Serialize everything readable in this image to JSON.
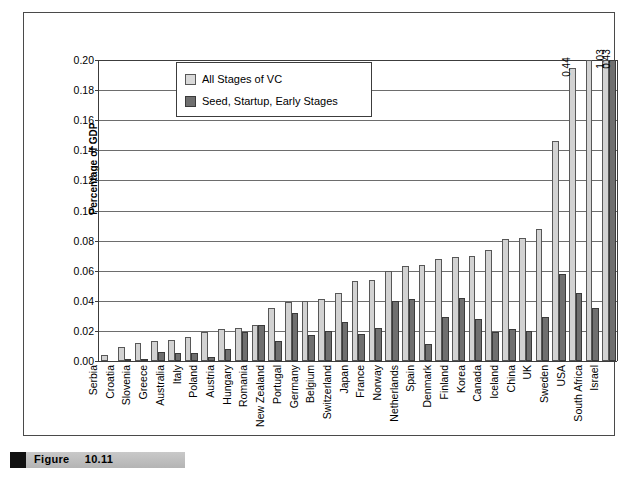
{
  "figure": {
    "caption_label": "Figure",
    "caption_number": "10.11"
  },
  "legend": {
    "position": "inside-top-left",
    "items": [
      {
        "label": "All Stages of VC",
        "color": "#d2d2d2",
        "swatch": "light-square-icon"
      },
      {
        "label": "Seed, Startup, Early Stages",
        "color": "#6f6f6f",
        "swatch": "dark-square-icon"
      }
    ]
  },
  "chart_data": {
    "type": "bar",
    "title": "",
    "subtitle": "",
    "xlabel": "",
    "ylabel": "Percentage of GDP",
    "ylim": [
      0.0,
      0.2
    ],
    "ytick_values": [
      0.0,
      0.02,
      0.04,
      0.06,
      0.08,
      0.1,
      0.12,
      0.14,
      0.16,
      0.18,
      0.2
    ],
    "ytick_labels": [
      "0.00",
      "0.02",
      "0.04",
      "0.06",
      "0.08",
      "0.10",
      "0.12",
      "0.14",
      "0.16",
      "0.18",
      "0.20"
    ],
    "grid": true,
    "grid_axis": "y",
    "legend_position": "inside-top-left",
    "categories": [
      "Serbia",
      "Croatia",
      "Slovenia",
      "Greece",
      "Australia",
      "Italy",
      "Poland",
      "Austria",
      "Hungary",
      "Romania",
      "New Zealand",
      "Portugal",
      "Germany",
      "Belgium",
      "Switzerland",
      "Japan",
      "France",
      "Norway",
      "Netherlands",
      "Spain",
      "Denmark",
      "Finland",
      "Korea",
      "Canada",
      "Iceland",
      "China",
      "UK",
      "Sweden",
      "USA",
      "South Africa",
      "Israel"
    ],
    "series": [
      {
        "name": "All Stages of VC",
        "color": "#d2d2d2",
        "values": [
          0.004,
          0.009,
          0.012,
          0.013,
          0.014,
          0.016,
          0.019,
          0.021,
          0.022,
          0.024,
          0.035,
          0.039,
          0.04,
          0.041,
          0.045,
          0.053,
          0.054,
          0.06,
          0.063,
          0.064,
          0.068,
          0.069,
          0.07,
          0.074,
          0.081,
          0.082,
          0.088,
          0.146,
          0.195,
          0.44,
          1.03
        ]
      },
      {
        "name": "Seed, Startup, Early Stages",
        "color": "#6f6f6f",
        "values": [
          0.0,
          0.001,
          0.001,
          0.006,
          0.005,
          0.005,
          0.003,
          0.008,
          0.019,
          0.024,
          0.013,
          0.032,
          0.017,
          0.02,
          0.026,
          0.018,
          0.022,
          0.04,
          0.041,
          0.011,
          0.029,
          0.042,
          0.028,
          0.019,
          0.021,
          0.02,
          0.029,
          0.058,
          0.045,
          0.035,
          0.43
        ]
      }
    ],
    "value_labels": [
      {
        "category": "USA",
        "series": "All Stages of VC",
        "text": "0.44"
      },
      {
        "category": "Israel",
        "series": "All Stages of VC",
        "text": "1.03"
      },
      {
        "category": "Israel",
        "series": "Seed, Startup, Early Stages",
        "text": "0.43"
      }
    ]
  }
}
